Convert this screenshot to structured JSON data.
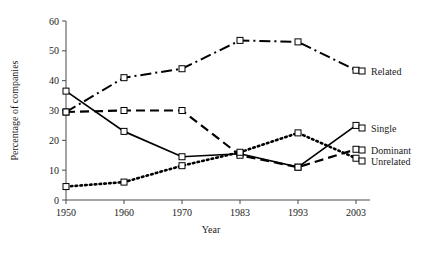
{
  "chart_data": {
    "type": "line",
    "title": "",
    "xlabel": "Year",
    "ylabel": "Percentage of companies",
    "categories": [
      "1950",
      "1960",
      "1970",
      "1983",
      "1993",
      "2003"
    ],
    "ylim": [
      0,
      60
    ],
    "yticks": [
      0,
      10,
      20,
      30,
      40,
      50,
      60
    ],
    "grid": false,
    "legend_position": "right",
    "series": [
      {
        "name": "Related",
        "linestyle": "dash-dot",
        "marker": "open-square",
        "values": [
          29.5,
          41,
          44,
          53.5,
          53,
          43.5
        ]
      },
      {
        "name": "Single",
        "linestyle": "solid",
        "marker": "open-square",
        "values": [
          36.5,
          23,
          14.5,
          15.5,
          11,
          25
        ]
      },
      {
        "name": "Dominant",
        "linestyle": "dashed",
        "marker": "open-square",
        "values": [
          29.5,
          30,
          30,
          15,
          11,
          17
        ]
      },
      {
        "name": "Unrelated",
        "linestyle": "dotted",
        "marker": "open-square",
        "values": [
          4.5,
          6,
          11.5,
          16,
          22.5,
          14
        ]
      }
    ]
  },
  "legend": {
    "entries": [
      {
        "label": "Related"
      },
      {
        "label": "Single"
      },
      {
        "label": "Dominant"
      },
      {
        "label": "Unrelated"
      }
    ]
  },
  "axes": {
    "y_title": "Percentage of companies",
    "x_title": "Year",
    "y_tick_labels": [
      "0",
      "10",
      "20",
      "30",
      "40",
      "50",
      "60"
    ],
    "x_tick_labels": [
      "1950",
      "1960",
      "1970",
      "1983",
      "1993",
      "2003"
    ]
  }
}
